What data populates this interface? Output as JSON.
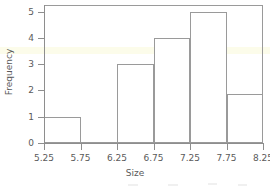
{
  "chart_data": {
    "type": "bar",
    "title": "",
    "subtitle": "",
    "xlabel": "Size",
    "ylabel": "Frequency",
    "xlim": [
      5.25,
      8.25
    ],
    "ylim": [
      0,
      5.3
    ],
    "grid": false,
    "legend": null,
    "x_tick_labels": [
      "5.25",
      "5.75",
      "6.25",
      "6.75",
      "7.25",
      "7.75",
      "8.25"
    ],
    "y_tick_labels": [
      "0",
      "1",
      "2",
      "3",
      "4",
      "5"
    ],
    "bin_edges": [
      5.25,
      5.75,
      6.25,
      6.75,
      7.25,
      7.75,
      8.25
    ],
    "categories": [
      "5.25-5.75",
      "5.75-6.25",
      "6.25-6.75",
      "6.75-7.25",
      "7.25-7.75",
      "7.75-8.25"
    ],
    "values": [
      1,
      0,
      3,
      4,
      5,
      1.85
    ],
    "bar_fill": "#ffffff",
    "bar_stroke": "#9a9a9a",
    "axis_color": "#8e8e8e",
    "text_color": "#5a5a5a",
    "background": "#ffffff",
    "highlight_band_color": "#fbfbe6",
    "annotations": []
  }
}
